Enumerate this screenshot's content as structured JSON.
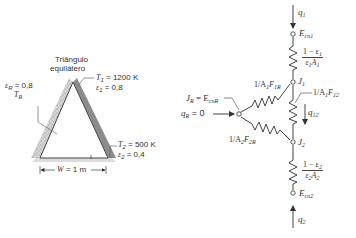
{
  "left_figure": {
    "title_line1": "Triângulo",
    "title_line2": "equilátero",
    "eps_R_label": "ε",
    "eps_R_sub": "R",
    "eps_R_value": " = 0,8",
    "T_R_label": "T",
    "T_R_sub": "R",
    "T1_label": "T",
    "T1_sub": "1",
    "T1_value": " = 1200 K",
    "eps1_label": "ε",
    "eps1_sub": "1",
    "eps1_value": " = 0,8",
    "T2_label": "T",
    "T2_sub": "2",
    "T2_value": " = 500 K",
    "eps2_label": "ε",
    "eps2_sub": "2",
    "eps2_value": " = 0,4",
    "width_label": "W",
    "width_value": " = 1 m"
  },
  "network": {
    "q1": {
      "sym": "q",
      "sub": "1"
    },
    "Ecn1": {
      "sym": "E",
      "sub": "cn1"
    },
    "R1": {
      "num_pre": "1 − ε",
      "num_sub": "1",
      "den_sym": "ε",
      "den_sub1": "1",
      "den_A": "A",
      "den_sub2": "1"
    },
    "J1": {
      "sym": "J",
      "sub": "1"
    },
    "R1R": {
      "pre": "1/A",
      "sub1": "1",
      "F": "F",
      "sub2": "1R"
    },
    "R12": {
      "pre": "1/A",
      "sub1": "1",
      "F": "F",
      "sub2": "12"
    },
    "q12": {
      "sym": "q",
      "sub": "12"
    },
    "JR": {
      "sym": "J",
      "sub": "R",
      "eq": " = E",
      "eq_sub": "cnR"
    },
    "qR": {
      "sym": "q",
      "sub": "R",
      "value": " = 0"
    },
    "R2R": {
      "pre": "1/A",
      "sub1": "2",
      "F": "F",
      "sub2": "2R"
    },
    "J2": {
      "sym": "J",
      "sub": "2"
    },
    "R2": {
      "num_pre": "1 − ε",
      "num_sub": "2",
      "den_sym": "ε",
      "den_sub1": "2",
      "den_A": "A",
      "den_sub2": "2"
    },
    "Ecn2": {
      "sym": "E",
      "sub": "cn2"
    },
    "q2": {
      "sym": "q",
      "sub": "2"
    }
  },
  "colors": {
    "line": "#444444",
    "reradiating_band": "#c8c8c8",
    "hot_band": "#8a8a8a",
    "base_band": "#d9d9d9"
  }
}
